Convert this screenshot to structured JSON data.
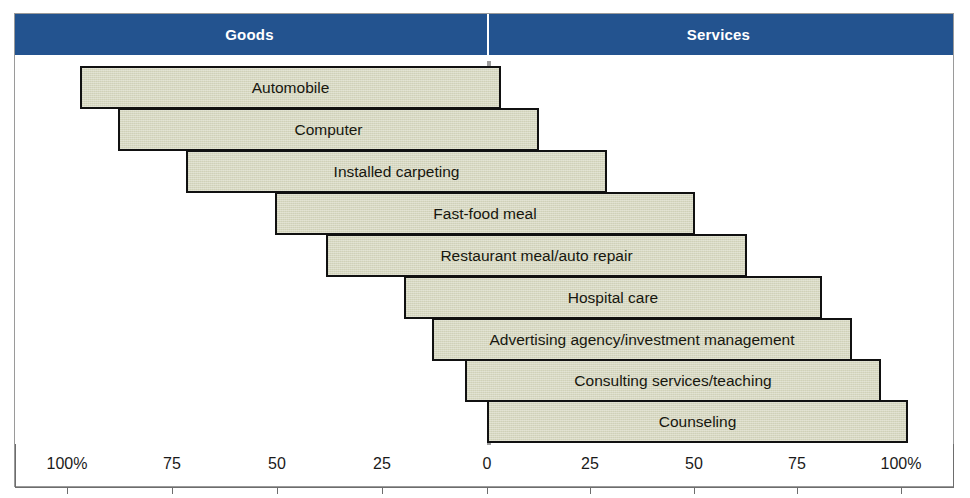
{
  "colors": {
    "header_band": "#23538f",
    "header_text": "#ffffff",
    "bar_fill": "#d7d8c0",
    "bar_border": "#111111",
    "zero_line": "#9d9d9d",
    "axis": "#6d6d6d",
    "frame": "#9a9a9a",
    "background": "#ffffff"
  },
  "header": {
    "left_label": "Goods",
    "right_label": "Services"
  },
  "axis": {
    "left_ticks": [
      "100%",
      "75",
      "50",
      "25",
      "0"
    ],
    "right_ticks": [
      "0",
      "25",
      "50",
      "75",
      "100%"
    ],
    "tick_labels": [
      "100%",
      "75",
      "50",
      "25",
      "0",
      "25",
      "50",
      "75",
      "100%"
    ],
    "tick_positions_px": [
      67,
      172,
      277,
      382,
      487,
      590,
      694,
      797,
      901
    ]
  },
  "chart_data": {
    "type": "bar",
    "orientation": "horizontal",
    "title": "",
    "subtitle": "",
    "xlabel": "",
    "ylabel": "",
    "xlim": [
      -100,
      100
    ],
    "grid": false,
    "legend": [
      "Goods",
      "Services"
    ],
    "legend_position": "top",
    "note": "Diverging bar chart (goods-services continuum). Each bar spans a goods percentage to the left of 0 and a services percentage to the right of 0.",
    "categories": [
      "Automobile",
      "Computer",
      "Installed carpeting",
      "Fast-food meal",
      "Restaurant meal/auto repair",
      "Hospital care",
      "Advertising agency/investment management",
      "Consulting services/teaching",
      "Counseling"
    ],
    "series": [
      {
        "name": "Goods",
        "values": [
          97,
          88,
          72,
          50,
          38,
          20,
          13,
          5,
          0
        ]
      },
      {
        "name": "Services",
        "values": [
          3,
          13,
          29,
          50,
          63,
          81,
          88,
          95,
          100
        ]
      }
    ],
    "bars": [
      {
        "label": "Automobile",
        "goods_pct": 97,
        "services_pct": 3,
        "left_px": 80,
        "right_px": 501,
        "top_px": 66,
        "height_px": 43
      },
      {
        "label": "Computer",
        "goods_pct": 88,
        "services_pct": 13,
        "left_px": 118,
        "right_px": 539,
        "top_px": 108,
        "height_px": 43
      },
      {
        "label": "Installed carpeting",
        "goods_pct": 72,
        "services_pct": 29,
        "left_px": 186,
        "right_px": 607,
        "top_px": 150,
        "height_px": 43
      },
      {
        "label": "Fast-food meal",
        "goods_pct": 50,
        "services_pct": 50,
        "left_px": 275,
        "right_px": 695,
        "top_px": 192,
        "height_px": 43
      },
      {
        "label": "Restaurant meal/auto repair",
        "goods_pct": 38,
        "services_pct": 63,
        "left_px": 326,
        "right_px": 747,
        "top_px": 234,
        "height_px": 43
      },
      {
        "label": "Hospital care",
        "goods_pct": 20,
        "services_pct": 81,
        "left_px": 404,
        "right_px": 822,
        "top_px": 276,
        "height_px": 43
      },
      {
        "label": "Advertising agency/investment management",
        "goods_pct": 13,
        "services_pct": 88,
        "left_px": 432,
        "right_px": 852,
        "top_px": 318,
        "height_px": 43
      },
      {
        "label": "Consulting services/teaching",
        "goods_pct": 5,
        "services_pct": 95,
        "left_px": 465,
        "right_px": 881,
        "top_px": 359,
        "height_px": 43
      },
      {
        "label": "Counseling",
        "goods_pct": 0,
        "services_pct": 100,
        "left_px": 487,
        "right_px": 908,
        "top_px": 400,
        "height_px": 43
      }
    ]
  }
}
